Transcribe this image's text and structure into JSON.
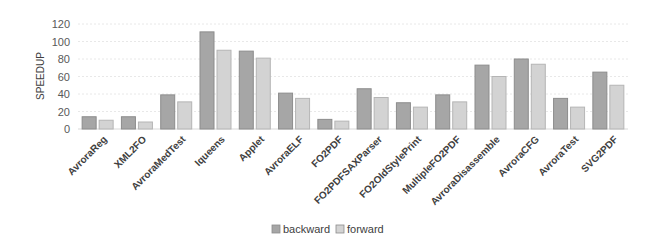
{
  "chart_data": {
    "type": "bar",
    "title": "",
    "xlabel": "",
    "ylabel": "SPEEDUP",
    "ylim": [
      0,
      120
    ],
    "yticks": [
      0,
      20,
      40,
      60,
      80,
      100,
      120
    ],
    "grid": true,
    "legend_position": "bottom",
    "categories": [
      "AvroraReg",
      "XML2FO",
      "AvroraMedTest",
      "Iqueens",
      "Applet",
      "AvroraELF",
      "FO2PDF",
      "FO2PDFSAXParser",
      "FO2OldStylePrint",
      "MultipleFO2PDF",
      "AvroraDisassemble",
      "AvroraCFG",
      "AvroraTest",
      "SVG2PDF"
    ],
    "series": [
      {
        "name": "backward",
        "color": "#a6a6a6",
        "values": [
          14,
          14,
          39,
          111,
          89,
          41,
          11,
          46,
          30,
          39,
          73,
          80,
          35,
          65
        ]
      },
      {
        "name": "forward",
        "color": "#d3d3d3",
        "values": [
          10,
          8,
          31,
          90,
          81,
          35,
          9,
          36,
          25,
          31,
          60,
          74,
          25,
          50
        ]
      }
    ]
  }
}
